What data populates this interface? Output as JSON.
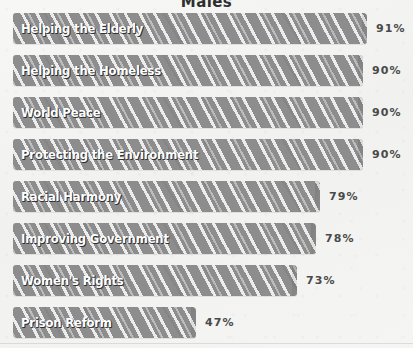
{
  "chart_data": {
    "type": "bar",
    "orientation": "horizontal",
    "title": "Males",
    "xlabel": "",
    "ylabel": "",
    "xlim": [
      0,
      100
    ],
    "grid": false,
    "legend": false,
    "value_suffix": "%",
    "bar_color": "#8d8d8d",
    "label_color": "#ffffff",
    "value_color": "#4a4a4a",
    "background_color": "#f4f4f2",
    "categories": [
      "Helping the Elderly",
      "Helping the Homeless",
      "World Peace",
      "Protecting the Environment",
      "Racial Harmony",
      "Improving Government",
      "Women's Rights",
      "Prison Reform"
    ],
    "values": [
      91,
      90,
      90,
      90,
      79,
      78,
      73,
      47
    ],
    "value_labels": [
      "91%",
      "90%",
      "90%",
      "90%",
      "79%",
      "78%",
      "73%",
      "47%"
    ]
  }
}
